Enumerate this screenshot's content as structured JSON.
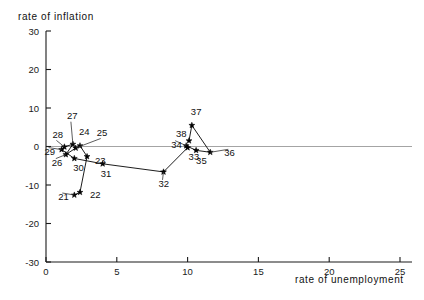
{
  "chart_data": {
    "type": "scatter",
    "title": "",
    "ylabel": "rate of inflation",
    "xlabel": "rate of unemployment",
    "xlim": [
      0,
      25
    ],
    "ylim": [
      -30,
      30
    ],
    "xticks": [
      0,
      5,
      10,
      15,
      20,
      25
    ],
    "yticks": [
      30,
      20,
      10,
      0,
      -10,
      -20,
      -30
    ],
    "xtick_labels": [
      "0",
      "5",
      "10",
      "15",
      "20",
      "25"
    ],
    "ytick_labels": [
      "30",
      "20",
      "10",
      "0",
      "-10",
      "-20",
      "-30"
    ],
    "grid": false,
    "legend": "none",
    "zero_reference_line": 0,
    "connected": true,
    "series": [
      {
        "name": "inflation vs unemployment by year",
        "points": [
          {
            "label": "21",
            "x": 2.0,
            "y": -12.6
          },
          {
            "label": "22",
            "x": 2.4,
            "y": -11.9
          },
          {
            "label": "23",
            "x": 2.9,
            "y": -2.6
          },
          {
            "label": "24",
            "x": 2.4,
            "y": 0.2
          },
          {
            "label": "25",
            "x": 2.1,
            "y": -0.4
          },
          {
            "label": "26",
            "x": 1.4,
            "y": -2.1
          },
          {
            "label": "27",
            "x": 1.9,
            "y": 0.6
          },
          {
            "label": "28",
            "x": 1.3,
            "y": -0.1
          },
          {
            "label": "29",
            "x": 1.1,
            "y": -0.8
          },
          {
            "label": "30",
            "x": 2.0,
            "y": -3.1
          },
          {
            "label": "31",
            "x": 4.0,
            "y": -4.5
          },
          {
            "label": "32",
            "x": 8.3,
            "y": -6.6
          },
          {
            "label": "33",
            "x": 10.0,
            "y": -0.3
          },
          {
            "label": "34",
            "x": 9.9,
            "y": 0.2
          },
          {
            "label": "35",
            "x": 10.6,
            "y": -1.0
          },
          {
            "label": "36",
            "x": 11.6,
            "y": -1.5
          },
          {
            "label": "37",
            "x": 10.3,
            "y": 5.5
          },
          {
            "label": "38",
            "x": 10.1,
            "y": 1.5
          }
        ]
      }
    ]
  }
}
